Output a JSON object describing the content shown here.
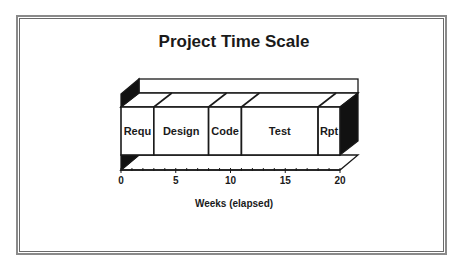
{
  "chart_data": {
    "type": "bar",
    "subtype": "3d-stacked-horizontal-timeline",
    "title": "Project Time Scale",
    "xlabel": "Weeks (elapsed)",
    "ylabel": "",
    "xlim": [
      0,
      20
    ],
    "x_ticks": [
      0,
      5,
      10,
      15,
      20
    ],
    "minor_tick_step": 1,
    "grid": false,
    "legend": null,
    "categories": [
      "Requ",
      "Design",
      "Code",
      "Test",
      "Rpt"
    ],
    "segments": [
      {
        "label": "Requ",
        "start": 0,
        "end": 3,
        "duration": 3
      },
      {
        "label": "Design",
        "start": 3,
        "end": 8,
        "duration": 5
      },
      {
        "label": "Code",
        "start": 8,
        "end": 11,
        "duration": 3
      },
      {
        "label": "Test",
        "start": 11,
        "end": 18,
        "duration": 7
      },
      {
        "label": "Rpt",
        "start": 18,
        "end": 20,
        "duration": 2
      }
    ],
    "values": [
      3,
      5,
      3,
      7,
      2
    ]
  },
  "colors": {
    "outline": "#1a1a1a",
    "side_fill": "#111111",
    "face_fill": "#ffffff",
    "frame": "#8a8a8a"
  }
}
